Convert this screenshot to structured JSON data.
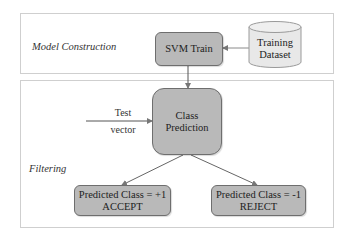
{
  "panels": {
    "model_construction": {
      "label": "Model Construction"
    },
    "filtering": {
      "label": "Filtering"
    }
  },
  "nodes": {
    "svm_train": {
      "label": "SVM Train"
    },
    "training_dataset": {
      "line1": "Training",
      "line2": "Dataset",
      "shape": "cylinder-icon"
    },
    "class_prediction": {
      "line1": "Class",
      "line2": "Prediction"
    },
    "accept": {
      "line1": "Predicted Class = +1",
      "line2": "ACCEPT"
    },
    "reject": {
      "line1": "Predicted Class = -1",
      "line2": "REJECT"
    }
  },
  "edges": {
    "test_vector": {
      "line1": "Test",
      "line2": "vector"
    }
  },
  "colors": {
    "node_fill": "#b9b9b9",
    "node_border": "#6e6e6e",
    "cylinder_fill": "#e8e8e8",
    "panel_border": "#cfcfcf",
    "arrow": "#777777"
  }
}
